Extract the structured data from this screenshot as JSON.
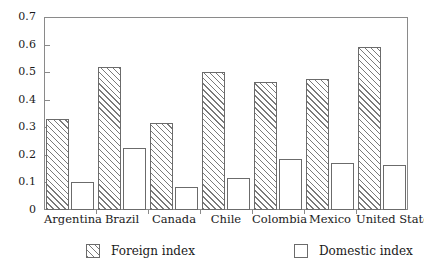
{
  "chart_data": {
    "type": "bar",
    "title": "",
    "subtitle": "",
    "xlabel": "",
    "ylabel": "",
    "grid": false,
    "legend_position": "bottom",
    "ylim": [
      0,
      0.7
    ],
    "ytick_labels": [
      "0.7",
      "0.6",
      "0.5",
      "0.4",
      "0.3",
      "0.2",
      "0.1",
      "0"
    ],
    "ytick_values": [
      0.7,
      0.6,
      0.5,
      0.4,
      0.3,
      0.2,
      0.1,
      0
    ],
    "categories": [
      "Argentina",
      "Brazil",
      "Canada",
      "Chile",
      "Colombia",
      "Mexico",
      "United States"
    ],
    "series": [
      {
        "name": "Foreign index",
        "fill": "hatched-diagonal",
        "values": [
          0.33,
          0.52,
          0.315,
          0.5,
          0.465,
          0.475,
          0.59
        ]
      },
      {
        "name": "Domestic index",
        "fill": "white",
        "values": [
          0.1,
          0.225,
          0.085,
          0.115,
          0.185,
          0.17,
          0.165
        ]
      }
    ],
    "colors": {
      "axis": "#8a8a8a",
      "bar_outline": "#6b6b6b",
      "hatch": "#7a7a7a",
      "background": "#ffffff",
      "text": "#1a1a1a"
    }
  },
  "legend": {
    "entries": [
      {
        "label": "Foreign index"
      },
      {
        "label": "Domestic index"
      }
    ]
  }
}
